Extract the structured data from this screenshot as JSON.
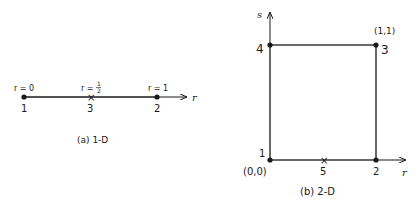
{
  "diagram_1d": {
    "caption": "(a) 1-D",
    "axis_label": "r",
    "nodes": [
      {
        "id": "1",
        "param": "r = 0"
      },
      {
        "id": "3",
        "param_prefix": "r =",
        "param_num": "1",
        "param_den": "2",
        "marker": "x"
      },
      {
        "id": "2",
        "param": "r = 1"
      }
    ]
  },
  "diagram_2d": {
    "caption": "(b) 2-D",
    "axis_r": "r",
    "axis_s": "s",
    "nodes": [
      {
        "id": "1",
        "coord": "(0,0)"
      },
      {
        "id": "2"
      },
      {
        "id": "3",
        "coord": "(1,1)"
      },
      {
        "id": "4"
      },
      {
        "id": "5",
        "marker": "x"
      }
    ]
  }
}
